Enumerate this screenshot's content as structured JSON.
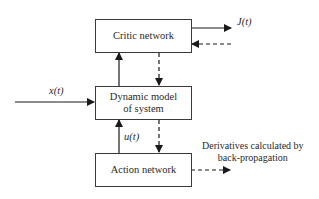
{
  "diagram": {
    "nodes": {
      "critic": "Critic network",
      "model_line1": "Dynamic model",
      "model_line2": "of system",
      "action": "Action network"
    },
    "labels": {
      "output": "J(t)",
      "input": "x(t)",
      "control": "u(t)",
      "derivatives_line1": "Derivatives calculated by",
      "derivatives_line2": "back-propagation"
    },
    "edges": [
      {
        "from": "input",
        "to": "model",
        "style": "solid"
      },
      {
        "from": "model",
        "to": "critic",
        "style": "solid"
      },
      {
        "from": "critic",
        "to": "output",
        "style": "solid"
      },
      {
        "from": "external",
        "to": "critic",
        "style": "dashed"
      },
      {
        "from": "critic",
        "to": "model",
        "style": "dashed"
      },
      {
        "from": "action",
        "to": "model",
        "style": "solid",
        "label": "u(t)"
      },
      {
        "from": "model",
        "to": "action",
        "style": "dashed"
      },
      {
        "from": "action",
        "to": "derivatives",
        "style": "dashed"
      }
    ]
  }
}
